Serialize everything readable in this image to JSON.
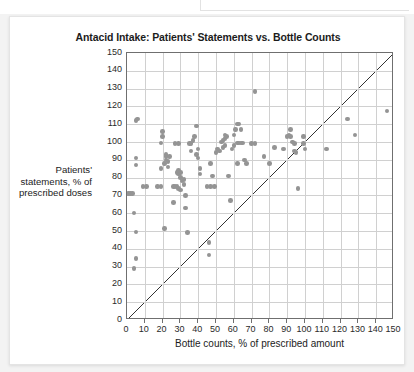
{
  "figure": {
    "title": "Antacid Intake: Patients' Statements vs. Bottle Counts",
    "x_axis_title": "Bottle counts, % of prescribed amount",
    "y_axis_title_line1": "Patients'",
    "y_axis_title_line2": "statements, % of",
    "y_axis_title_line3": "prescribed doses"
  },
  "colors": {
    "point": "#949494",
    "grid": "#d0d0d0",
    "frame": "#6f6f6f",
    "reference_line": "#333333",
    "text": "#1c1c1c",
    "card_background": "#ffffff",
    "page_background": "#f3f3f3"
  },
  "chart_data": {
    "type": "scatter",
    "title": "Antacid Intake: Patients' Statements vs. Bottle Counts",
    "xlabel": "Bottle counts, % of prescribed amount",
    "ylabel": "Patients' statements, % of prescribed doses",
    "xlim": [
      0,
      150
    ],
    "ylim": [
      0,
      150
    ],
    "xticks": [
      0,
      10,
      20,
      30,
      40,
      50,
      60,
      70,
      80,
      90,
      100,
      110,
      120,
      130,
      140,
      150
    ],
    "yticks": [
      0,
      10,
      20,
      30,
      40,
      50,
      60,
      70,
      80,
      90,
      100,
      110,
      120,
      130,
      140,
      150
    ],
    "xtick_labels": [
      "0",
      "10",
      "20",
      "30",
      "40",
      "50",
      "60",
      "70",
      "80",
      "90",
      "100",
      "110",
      "120",
      "130",
      "140",
      "150"
    ],
    "ytick_labels": [
      "0",
      "10",
      "20",
      "30",
      "40",
      "50",
      "60",
      "70",
      "80",
      "90",
      "100",
      "110",
      "120",
      "130",
      "140",
      "150"
    ],
    "grid": true,
    "legend": false,
    "annotations": [
      {
        "kind": "reference-line",
        "description": "45-degree line of identity y = x",
        "from": [
          0,
          0
        ],
        "to": [
          150,
          150
        ]
      }
    ],
    "series": [
      {
        "name": "Patients",
        "marker": "circle",
        "color": "#949494",
        "points": [
          [
            1,
            71
          ],
          [
            2,
            71
          ],
          [
            3,
            71
          ],
          [
            4,
            29
          ],
          [
            5,
            34.5
          ],
          [
            5,
            49.5
          ],
          [
            4,
            60
          ],
          [
            5,
            87
          ],
          [
            5,
            91
          ],
          [
            5,
            112
          ],
          [
            6,
            113
          ],
          [
            9,
            75
          ],
          [
            11,
            75
          ],
          [
            17,
            75
          ],
          [
            19,
            75
          ],
          [
            19,
            85
          ],
          [
            19,
            99.5
          ],
          [
            20,
            106
          ],
          [
            20,
            103
          ],
          [
            21,
            51.5
          ],
          [
            21,
            88
          ],
          [
            22,
            90
          ],
          [
            22,
            92
          ],
          [
            22,
            93
          ],
          [
            23,
            89
          ],
          [
            23,
            86
          ],
          [
            24,
            92
          ],
          [
            26,
            75
          ],
          [
            27,
            75
          ],
          [
            27,
            99
          ],
          [
            29,
            99
          ],
          [
            28,
            83
          ],
          [
            29,
            84
          ],
          [
            29,
            82
          ],
          [
            30,
            83
          ],
          [
            30,
            80
          ],
          [
            28,
            75
          ],
          [
            29,
            74
          ],
          [
            30,
            73
          ],
          [
            26,
            66
          ],
          [
            31,
            78
          ],
          [
            32,
            79
          ],
          [
            32,
            76
          ],
          [
            33,
            70
          ],
          [
            33,
            63
          ],
          [
            34,
            49
          ],
          [
            35,
            99
          ],
          [
            36,
            99
          ],
          [
            36,
            95
          ],
          [
            37,
            101
          ],
          [
            38,
            103
          ],
          [
            39,
            109
          ],
          [
            39,
            93
          ],
          [
            40,
            96
          ],
          [
            40,
            91
          ],
          [
            41,
            85
          ],
          [
            41,
            82
          ],
          [
            45,
            75
          ],
          [
            47,
            75
          ],
          [
            46,
            43.5
          ],
          [
            46,
            36.5
          ],
          [
            47,
            88
          ],
          [
            48,
            81
          ],
          [
            49,
            75
          ],
          [
            50,
            94
          ],
          [
            51,
            96
          ],
          [
            52,
            95
          ],
          [
            53,
            100
          ],
          [
            54,
            101
          ],
          [
            55,
            102
          ],
          [
            54,
            97
          ],
          [
            55,
            98
          ],
          [
            55,
            104
          ],
          [
            56,
            103
          ],
          [
            57,
            81
          ],
          [
            58,
            67
          ],
          [
            59,
            96
          ],
          [
            60,
            98
          ],
          [
            60,
            104
          ],
          [
            61,
            107
          ],
          [
            62,
            110
          ],
          [
            63,
            110
          ],
          [
            64,
            107
          ],
          [
            62,
            99.5
          ],
          [
            63,
            99.5
          ],
          [
            64,
            99.5
          ],
          [
            65,
            99.5
          ],
          [
            62,
            88
          ],
          [
            66,
            90
          ],
          [
            67,
            88
          ],
          [
            70,
            99
          ],
          [
            72,
            99
          ],
          [
            72,
            128.5
          ],
          [
            77,
            92
          ],
          [
            80,
            88
          ],
          [
            83,
            97
          ],
          [
            88,
            96
          ],
          [
            90,
            103
          ],
          [
            91,
            104
          ],
          [
            92,
            103
          ],
          [
            92,
            107
          ],
          [
            93,
            100
          ],
          [
            94,
            99
          ],
          [
            94,
            95
          ],
          [
            95,
            94
          ],
          [
            96,
            74
          ],
          [
            99,
            103
          ],
          [
            99,
            99
          ],
          [
            100,
            96
          ],
          [
            112,
            96
          ],
          [
            124,
            113
          ],
          [
            128,
            104
          ],
          [
            146,
            117.5
          ]
        ]
      }
    ]
  }
}
